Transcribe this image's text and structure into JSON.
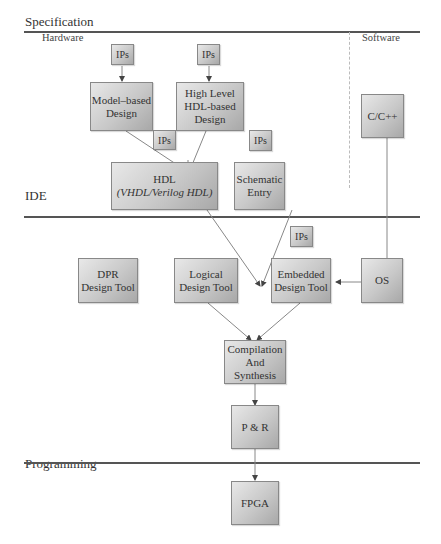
{
  "sections": {
    "specification": "Specification",
    "hardware": "Hardware",
    "software": "Software",
    "ide": "IDE",
    "programming": "Programming"
  },
  "nodes": {
    "ips_model": "IPs",
    "ips_highlevel": "IPs",
    "model_based": [
      "Model–based",
      "Design"
    ],
    "high_level": [
      "High Level",
      "HDL-based",
      "Design"
    ],
    "ips_hdl": "IPs",
    "ips_schematic": "IPs",
    "hdl": [
      "HDL",
      "(VHDL/Verilog HDL)"
    ],
    "schematic": [
      "Schematic",
      "Entry"
    ],
    "c_cpp": "C/C++",
    "ips_embedded": "IPs",
    "dpr": [
      "DPR",
      "Design Tool"
    ],
    "logical": [
      "Logical",
      "Design Tool"
    ],
    "embedded": [
      "Embedded",
      "Design Tool"
    ],
    "os": "OS",
    "compilation": [
      "Compilation",
      "And",
      "Synthesis"
    ],
    "pr": "P & R",
    "fpga": "FPGA"
  },
  "colors": {
    "box_light": "#e8e8e8",
    "box_dark": "#a8a8a8",
    "line": "#555555",
    "arrow": "#777777"
  }
}
